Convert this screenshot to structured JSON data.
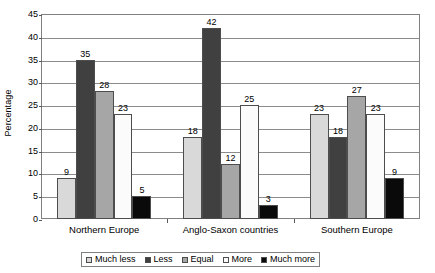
{
  "chart_data": {
    "type": "bar",
    "title": "",
    "xlabel": "",
    "ylabel": "Percentage",
    "ylim": [
      0,
      45
    ],
    "ytick_step": 5,
    "yticks": [
      45,
      40,
      35,
      30,
      25,
      20,
      15,
      10,
      5,
      0
    ],
    "grid": true,
    "legend_position": "bottom",
    "categories": [
      "Northern Europe",
      "Anglo-Saxon countries",
      "Southern Europe"
    ],
    "series": [
      {
        "name": "Much less",
        "color": "#d9d9d9",
        "values": [
          9,
          18,
          23
        ]
      },
      {
        "name": "Less",
        "color": "#404040",
        "values": [
          35,
          42,
          18
        ]
      },
      {
        "name": "Equal",
        "color": "#a6a6a6",
        "values": [
          28,
          12,
          27
        ]
      },
      {
        "name": "More",
        "color": "#fbfbfb",
        "values": [
          23,
          25,
          23
        ]
      },
      {
        "name": "Much more",
        "color": "#0a0a0a",
        "values": [
          5,
          3,
          9
        ]
      }
    ]
  },
  "legend": {
    "items": [
      {
        "label": "Much less"
      },
      {
        "label": "Less"
      },
      {
        "label": "Equal"
      },
      {
        "label": "More"
      },
      {
        "label": "Much more"
      }
    ]
  }
}
